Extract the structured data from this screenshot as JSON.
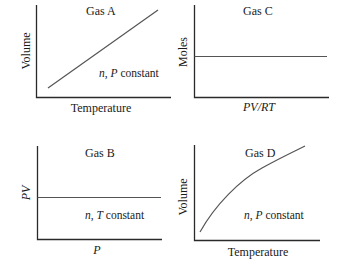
{
  "panels": {
    "a": {
      "title": "Gas A",
      "xlabel": "Temperature",
      "ylabel": "Volume",
      "note_var1": "n",
      "note_sep": ", ",
      "note_var2": "P",
      "note_rest": " constant",
      "relation": "linear increasing"
    },
    "b": {
      "title": "Gas B",
      "xlabel": "P",
      "ylabel": "PV",
      "note_var1": "n",
      "note_sep": ", ",
      "note_var2": "T",
      "note_rest": " constant",
      "relation": "constant (horizontal line)"
    },
    "c": {
      "title": "Gas C",
      "xlabel": "PV/RT",
      "ylabel": "Moles",
      "relation": "constant (horizontal line)"
    },
    "d": {
      "title": "Gas D",
      "xlabel": "Temperature",
      "ylabel": "Volume",
      "note_var1": "n",
      "note_sep": ", ",
      "note_var2": "P",
      "note_rest": " constant",
      "relation": "concave increasing curve"
    }
  },
  "colors": {
    "axis": "#2a2a2a",
    "line": "#555555",
    "text": "#1a1a1a",
    "background": "#ffffff"
  }
}
